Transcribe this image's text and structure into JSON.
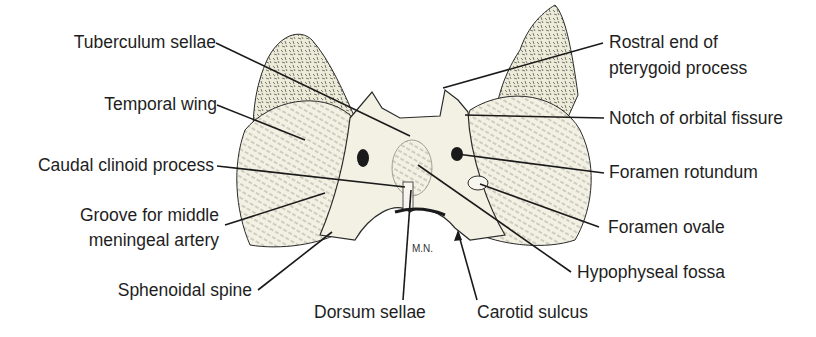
{
  "figure": {
    "signature": "M.N.",
    "colors": {
      "bone": "#f3f1e4",
      "wing": "#e8e6d2",
      "ink": "#1e1e1e",
      "hatch": "#6b6a5e"
    }
  },
  "labels": {
    "left": [
      {
        "text": "Tuberculum sellae"
      },
      {
        "text": "Temporal wing"
      },
      {
        "text": "Caudal clinoid process"
      },
      {
        "text": "Groove for middle",
        "text2": "meningeal artery"
      },
      {
        "text": "Sphenoidal spine"
      }
    ],
    "right": [
      {
        "text": "Rostral end of",
        "text2": "pterygoid process"
      },
      {
        "text": "Notch of orbital fissure"
      },
      {
        "text": "Foramen rotundum"
      },
      {
        "text": "Foramen ovale"
      },
      {
        "text": "Hypophyseal fossa"
      }
    ],
    "bottom": [
      {
        "text": "Dorsum sellae"
      },
      {
        "text": "Carotid sulcus"
      }
    ]
  }
}
